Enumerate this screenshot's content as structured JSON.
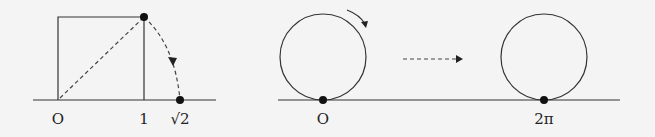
{
  "left_figure": {
    "description": "unit square with diagonal rotated onto number line",
    "labels": {
      "origin": "O",
      "one": "1",
      "sqrt_two": "√2"
    }
  },
  "right_figure": {
    "description": "circle rolling along number line one full revolution",
    "labels": {
      "origin": "O",
      "two_pi": "2π"
    }
  },
  "colors": {
    "background": "#f4f4f4",
    "stroke": "#333333",
    "dot": "#111111"
  }
}
